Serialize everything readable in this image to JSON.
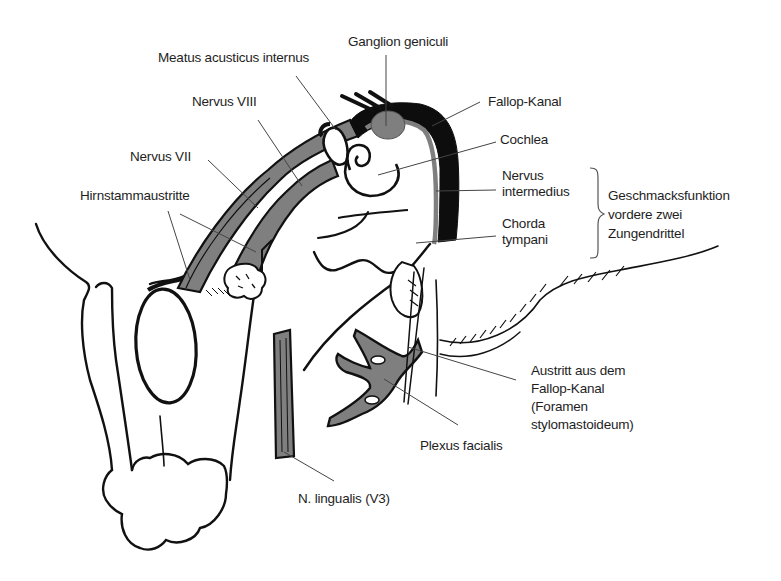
{
  "diagram": {
    "type": "anatomical-illustration",
    "colors": {
      "line": "#111111",
      "nerve_fill": "#7f7f7f",
      "canal_fill": "#0d0d0d",
      "leader_line": "#444444",
      "text": "#1e1e1e",
      "background": "#ffffff"
    }
  },
  "labels": {
    "ganglion_geniculi": "Ganglion geniculi",
    "meatus_acusticus_internus": "Meatus acusticus internus",
    "nervus_viii": "Nervus VIII",
    "fallop_kanal": "Fallop-Kanal",
    "cochlea": "Cochlea",
    "nervus_vii": "Nervus VII",
    "nervus_intermedius": [
      "Nervus",
      "intermedius"
    ],
    "hirnstammaustritte": "Hirnstammaustritte",
    "chorda_tympani": [
      "Chorda",
      "tympani"
    ],
    "geschmacksfunktion": [
      "Geschmacksfunktion",
      "vordere zwei",
      "Zungendrittel"
    ],
    "austritt": [
      "Austritt aus dem",
      "Fallop-Kanal",
      "(Foramen",
      "stylomastoideum)"
    ],
    "plexus_facialis": "Plexus facialis",
    "n_lingualis": "N. lingualis (V3)"
  }
}
